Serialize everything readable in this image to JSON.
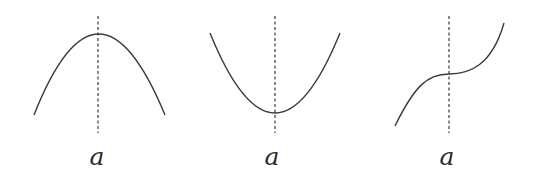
{
  "diagram": {
    "panels": [
      {
        "id": "local-maximum",
        "shape": "concave-down parabola",
        "label": "a",
        "axis_x": 98,
        "axis_y": [
          16,
          133
        ],
        "curve_path": "M34,115 Q98,-47 165,115"
      },
      {
        "id": "local-minimum",
        "shape": "concave-up parabola",
        "label": "a",
        "axis_x": 275,
        "axis_y": [
          16,
          133
        ],
        "curve_path": "M210,33 Q275,193 340,33"
      },
      {
        "id": "inflection-point",
        "shape": "cubic with horizontal inflection",
        "label": "a",
        "axis_x": 449,
        "axis_y": [
          16,
          133
        ],
        "curve_path": "M395,126 C415,85 428,74 449,74 C470,74 492,65 504,23"
      }
    ],
    "colors": {
      "stroke": "#3a3a3a",
      "background": "#ffffff"
    }
  }
}
